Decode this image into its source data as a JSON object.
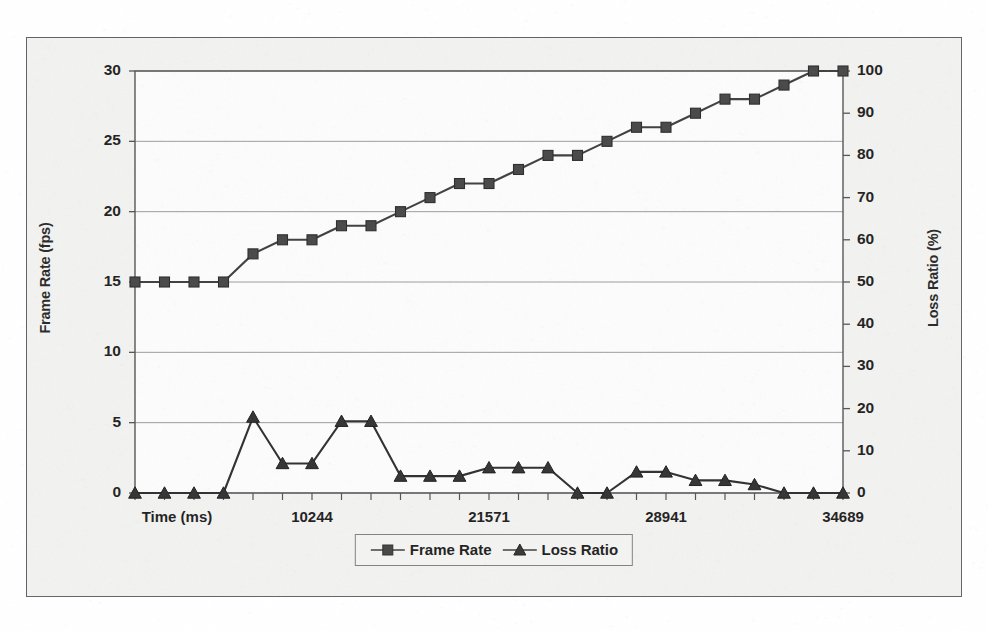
{
  "chart_data": {
    "type": "line",
    "title": "",
    "subtitle": "",
    "xlabel": "Time (ms)",
    "ylabel": "Frame Rate (fps)",
    "y2label": "Loss Ratio (%)",
    "ylim": [
      0,
      30
    ],
    "y2lim": [
      0,
      100
    ],
    "y_ticks": [
      0,
      5,
      10,
      15,
      20,
      25,
      30
    ],
    "y2_ticks": [
      0,
      10,
      20,
      30,
      40,
      50,
      60,
      70,
      80,
      90,
      100
    ],
    "x_tick_labels": [
      "Time (ms)",
      "10244",
      "21571",
      "28941",
      "34689"
    ],
    "grid": true,
    "legend_position": "bottom",
    "x": [
      0,
      1,
      2,
      3,
      4,
      5,
      6,
      7,
      8,
      9,
      10,
      11,
      12,
      13,
      14,
      15,
      16,
      17,
      18,
      19,
      20,
      21,
      22,
      23,
      24
    ],
    "series": [
      {
        "name": "Frame Rate",
        "axis": "left",
        "marker": "square",
        "color": "#333333",
        "values": [
          15,
          15,
          15,
          15,
          17,
          18,
          18,
          19,
          19,
          20,
          21,
          22,
          22,
          23,
          24,
          24,
          25,
          26,
          26,
          27,
          28,
          28,
          29,
          30,
          30
        ]
      },
      {
        "name": "Loss Ratio",
        "axis": "right",
        "marker": "triangle",
        "color": "#222222",
        "values": [
          0,
          0,
          0,
          0,
          18,
          7,
          7,
          17,
          17,
          4,
          4,
          4,
          6,
          6,
          6,
          0,
          0,
          5,
          5,
          3,
          3,
          2,
          0,
          0,
          0
        ]
      }
    ]
  },
  "legend": {
    "entries": [
      {
        "label": "Frame Rate",
        "marker": "square-marker-icon"
      },
      {
        "label": "Loss Ratio",
        "marker": "triangle-marker-icon"
      }
    ]
  },
  "axes": {
    "left_title": "Frame Rate (fps)",
    "right_title": "Loss Ratio (%)",
    "x_first_label": "Time (ms)"
  }
}
